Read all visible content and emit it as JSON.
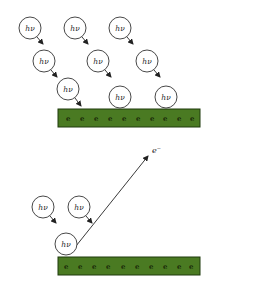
{
  "diagram": {
    "photon_label": "hν",
    "electron_label": "e",
    "emitted_electron_label": "e⁻",
    "colors": {
      "plate_fill": "#4a7a22",
      "plate_stroke": "#1f3a0c",
      "circle_stroke": "#333333",
      "arrow": "#222222"
    }
  },
  "top_panel": {
    "photons": [
      {
        "label": "hν",
        "cx": 30,
        "cy": 28
      },
      {
        "label": "hν",
        "cx": 75,
        "cy": 28
      },
      {
        "label": "hν",
        "cx": 120,
        "cy": 28
      },
      {
        "label": "hν",
        "cx": 44,
        "cy": 61
      },
      {
        "label": "hν",
        "cx": 98,
        "cy": 61
      },
      {
        "label": "hν",
        "cx": 147,
        "cy": 61
      },
      {
        "label": "hν",
        "cx": 68,
        "cy": 89
      },
      {
        "label": "hν",
        "cx": 120,
        "cy": 97
      },
      {
        "label": "hν",
        "cx": 166,
        "cy": 97
      }
    ],
    "plate": {
      "electrons": [
        "e",
        "e",
        "e",
        "e",
        "e",
        "e",
        "e",
        "e",
        "e",
        "e"
      ]
    }
  },
  "bottom_panel": {
    "photons": [
      {
        "label": "hν",
        "cx": 43,
        "cy": 207
      },
      {
        "label": "hν",
        "cx": 79,
        "cy": 207
      },
      {
        "label": "hν",
        "cx": 66,
        "cy": 244
      }
    ],
    "plate": {
      "electrons": [
        "e",
        "e",
        "e",
        "e",
        "e",
        "e",
        "e",
        "e",
        "e",
        "e"
      ]
    },
    "emitted_electron": {
      "label": "e⁻"
    }
  }
}
